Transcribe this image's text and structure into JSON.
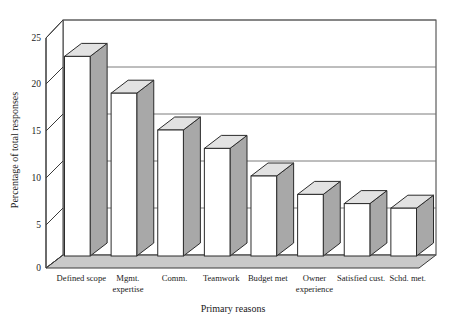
{
  "chart_data": {
    "type": "bar",
    "title": "",
    "subtitle": "",
    "xlabel": "Primary reasons",
    "ylabel": "Percentage of total responses",
    "categories": [
      "Defined scope",
      "Mgmt. expertise",
      "Comm.",
      "Teamwork",
      "Budget met",
      "Owner experience",
      "Satisfied cust.",
      "Schd. met."
    ],
    "category_lines": [
      [
        "Defined scope"
      ],
      [
        "Mgmt.",
        "expertise"
      ],
      [
        "Comm."
      ],
      [
        "Teamwork"
      ],
      [
        "Budget met"
      ],
      [
        "Owner",
        "experience"
      ],
      [
        "Satisfied cust."
      ],
      [
        "Schd. met."
      ]
    ],
    "values": [
      23,
      19,
      15,
      13,
      10,
      8,
      7,
      6.5
    ],
    "ylim": [
      0,
      25
    ],
    "ytick_values": [
      0,
      5,
      10,
      15,
      20,
      25
    ],
    "ytick_labels": [
      "0",
      "5",
      "10",
      "15",
      "20",
      "25"
    ],
    "grid": true,
    "grid_axis": "y",
    "legend": "none",
    "style": "3d-column",
    "colors": {
      "bar_front": "#ffffff",
      "bar_side": "#a8a8a8",
      "bar_top": "#e2e2e2",
      "floor": "#c9c9c9",
      "axis": "#3a3a3a",
      "grid": "#6e6e6e",
      "text": "#1a1a1a",
      "background": "#ffffff"
    }
  },
  "axes": {
    "y_title": "Percentage of total responses",
    "x_title": "Primary reasons"
  },
  "ticks": {
    "y": [
      {
        "label": "25",
        "value": 25
      },
      {
        "label": "20",
        "value": 20
      },
      {
        "label": "15",
        "value": 15
      },
      {
        "label": "10",
        "value": 10
      },
      {
        "label": "5",
        "value": 5
      },
      {
        "label": "0",
        "value": 0
      }
    ]
  }
}
